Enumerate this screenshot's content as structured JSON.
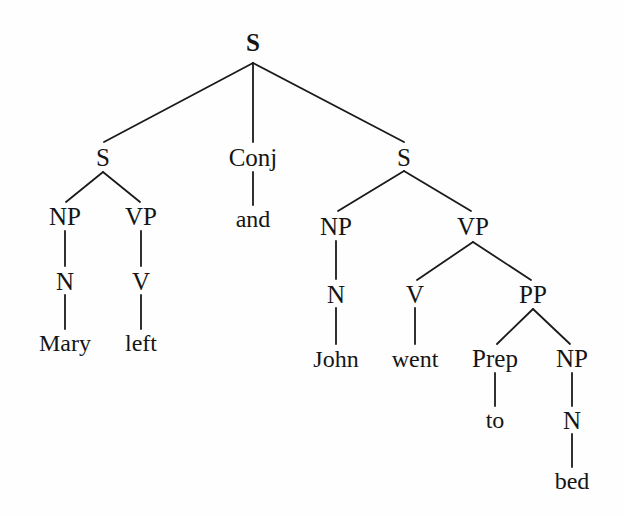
{
  "diagram": {
    "type": "syntax-tree",
    "background_color": "#fefefe",
    "line_color": "#1a1a1a",
    "text_color": "#151515",
    "sentence": "Mary left and John went to bed"
  },
  "nodes": [
    {
      "id": "S-root",
      "label": "S",
      "kind": "category",
      "x": 253,
      "y": 42,
      "root": true
    },
    {
      "id": "S-left",
      "label": "S",
      "kind": "category",
      "x": 103,
      "y": 157
    },
    {
      "id": "Conj",
      "label": "Conj",
      "kind": "category",
      "x": 253,
      "y": 157
    },
    {
      "id": "S-right",
      "label": "S",
      "kind": "category",
      "x": 404,
      "y": 157
    },
    {
      "id": "NP-left",
      "label": "NP",
      "kind": "category",
      "x": 65,
      "y": 216
    },
    {
      "id": "VP-left",
      "label": "VP",
      "kind": "category",
      "x": 141,
      "y": 216
    },
    {
      "id": "and",
      "label": "and",
      "kind": "word",
      "x": 253,
      "y": 219
    },
    {
      "id": "NP-right",
      "label": "NP",
      "kind": "category",
      "x": 336,
      "y": 226
    },
    {
      "id": "VP-right",
      "label": "VP",
      "kind": "category",
      "x": 473,
      "y": 226
    },
    {
      "id": "N-mary",
      "label": "N",
      "kind": "category",
      "x": 65,
      "y": 281
    },
    {
      "id": "V-left",
      "label": "V",
      "kind": "category",
      "x": 141,
      "y": 281
    },
    {
      "id": "N-john",
      "label": "N",
      "kind": "category",
      "x": 336,
      "y": 294
    },
    {
      "id": "V-went",
      "label": "V",
      "kind": "category",
      "x": 415,
      "y": 294
    },
    {
      "id": "PP",
      "label": "PP",
      "kind": "category",
      "x": 533,
      "y": 294
    },
    {
      "id": "Mary",
      "label": "Mary",
      "kind": "word",
      "x": 65,
      "y": 343
    },
    {
      "id": "left",
      "label": "left",
      "kind": "word",
      "x": 141,
      "y": 343
    },
    {
      "id": "John",
      "label": "John",
      "kind": "word",
      "x": 336,
      "y": 359
    },
    {
      "id": "went",
      "label": "went",
      "kind": "word",
      "x": 415,
      "y": 359
    },
    {
      "id": "Prep",
      "label": "Prep",
      "kind": "category",
      "x": 495,
      "y": 358
    },
    {
      "id": "NP-bed",
      "label": "NP",
      "kind": "category",
      "x": 572,
      "y": 358
    },
    {
      "id": "to",
      "label": "to",
      "kind": "word",
      "x": 495,
      "y": 420
    },
    {
      "id": "N-bed",
      "label": "N",
      "kind": "category",
      "x": 572,
      "y": 420
    },
    {
      "id": "bed",
      "label": "bed",
      "kind": "word",
      "x": 572,
      "y": 481
    }
  ],
  "edges": [
    {
      "from": "S-root",
      "to": "S-left",
      "x1": 253,
      "y1": 63,
      "x2": 104,
      "y2": 142
    },
    {
      "from": "S-root",
      "to": "Conj",
      "x1": 253,
      "y1": 63,
      "x2": 253,
      "y2": 142
    },
    {
      "from": "S-root",
      "to": "S-right",
      "x1": 253,
      "y1": 63,
      "x2": 404,
      "y2": 142
    },
    {
      "from": "S-left",
      "to": "NP-left",
      "x1": 103,
      "y1": 172,
      "x2": 66,
      "y2": 202
    },
    {
      "from": "S-left",
      "to": "VP-left",
      "x1": 103,
      "y1": 172,
      "x2": 140,
      "y2": 202
    },
    {
      "from": "Conj",
      "to": "and",
      "x1": 253,
      "y1": 172,
      "x2": 253,
      "y2": 205
    },
    {
      "from": "S-right",
      "to": "NP-right",
      "x1": 404,
      "y1": 171,
      "x2": 338,
      "y2": 211
    },
    {
      "from": "S-right",
      "to": "VP-right",
      "x1": 404,
      "y1": 171,
      "x2": 471,
      "y2": 211
    },
    {
      "from": "NP-left",
      "to": "N-mary",
      "x1": 65,
      "y1": 231,
      "x2": 65,
      "y2": 266
    },
    {
      "from": "VP-left",
      "to": "V-left",
      "x1": 141,
      "y1": 231,
      "x2": 141,
      "y2": 266
    },
    {
      "from": "NP-right",
      "to": "N-john",
      "x1": 336,
      "y1": 241,
      "x2": 336,
      "y2": 279
    },
    {
      "from": "VP-right",
      "to": "V-went",
      "x1": 473,
      "y1": 242,
      "x2": 417,
      "y2": 280
    },
    {
      "from": "VP-right",
      "to": "PP",
      "x1": 473,
      "y1": 242,
      "x2": 531,
      "y2": 280
    },
    {
      "from": "N-mary",
      "to": "Mary",
      "x1": 65,
      "y1": 295,
      "x2": 65,
      "y2": 329
    },
    {
      "from": "V-left",
      "to": "left",
      "x1": 141,
      "y1": 295,
      "x2": 141,
      "y2": 329
    },
    {
      "from": "N-john",
      "to": "John",
      "x1": 336,
      "y1": 308,
      "x2": 336,
      "y2": 344
    },
    {
      "from": "V-went",
      "to": "went",
      "x1": 415,
      "y1": 308,
      "x2": 415,
      "y2": 344
    },
    {
      "from": "PP",
      "to": "Prep",
      "x1": 533,
      "y1": 309,
      "x2": 497,
      "y2": 344
    },
    {
      "from": "PP",
      "to": "NP-bed",
      "x1": 533,
      "y1": 309,
      "x2": 570,
      "y2": 344
    },
    {
      "from": "Prep",
      "to": "to",
      "x1": 495,
      "y1": 373,
      "x2": 495,
      "y2": 406
    },
    {
      "from": "NP-bed",
      "to": "N-bed",
      "x1": 572,
      "y1": 373,
      "x2": 572,
      "y2": 406
    },
    {
      "from": "N-bed",
      "to": "bed",
      "x1": 572,
      "y1": 434,
      "x2": 572,
      "y2": 467
    }
  ]
}
